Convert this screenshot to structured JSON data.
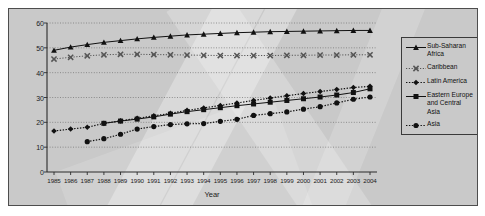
{
  "chart_data": {
    "type": "line",
    "title": "",
    "xlabel": "Year",
    "ylabel": "Percent female (%)",
    "xlim": [
      1985,
      2004
    ],
    "ylim": [
      0,
      60
    ],
    "ytick_step": 10,
    "yticks": [
      0,
      10,
      20,
      30,
      40,
      50,
      60
    ],
    "grid": true,
    "grid_style": "dotted-horizontal",
    "legend_position": "right-outside",
    "x": [
      1985,
      1986,
      1987,
      1988,
      1989,
      1990,
      1991,
      1992,
      1993,
      1994,
      1995,
      1996,
      1997,
      1998,
      1999,
      2000,
      2001,
      2002,
      2003,
      2004
    ],
    "categories": [
      "1985",
      "1986",
      "1987",
      "1988",
      "1989",
      "1990",
      "1991",
      "1992",
      "1993",
      "1994",
      "1995",
      "1996",
      "1997",
      "1998",
      "1999",
      "2000",
      "2001",
      "2002",
      "2003",
      "2004"
    ],
    "series": [
      {
        "name": "Sub-Saharan Africa",
        "marker": "triangle",
        "line": "solid",
        "color": "#111111",
        "x": [
          1985,
          1986,
          1987,
          1988,
          1989,
          1990,
          1991,
          1992,
          1993,
          1994,
          1995,
          1996,
          1997,
          1998,
          1999,
          2000,
          2001,
          2002,
          2003,
          2004
        ],
        "values": [
          49.0,
          50.3,
          51.3,
          52.2,
          52.9,
          53.6,
          54.2,
          54.7,
          55.2,
          55.5,
          55.8,
          56.1,
          56.3,
          56.5,
          56.6,
          56.7,
          56.8,
          56.9,
          57.0,
          57.0
        ]
      },
      {
        "name": "Caribbean",
        "marker": "x",
        "line": "dotted-light",
        "color": "#555555",
        "x": [
          1985,
          1986,
          1987,
          1988,
          1989,
          1990,
          1991,
          1992,
          1993,
          1994,
          1995,
          1996,
          1997,
          1998,
          1999,
          2000,
          2001,
          2002,
          2003,
          2004
        ],
        "values": [
          45.5,
          46.2,
          46.8,
          47.2,
          47.4,
          47.4,
          47.3,
          47.2,
          47.1,
          47.0,
          46.9,
          46.9,
          46.9,
          46.9,
          47.0,
          47.0,
          47.1,
          47.1,
          47.2,
          47.2
        ]
      },
      {
        "name": "Latin America",
        "marker": "diamond",
        "line": "dotted",
        "color": "#111111",
        "x": [
          1985,
          1986,
          1987,
          1988,
          1989,
          1990,
          1991,
          1992,
          1993,
          1994,
          1995,
          1996,
          1997,
          1998,
          1999,
          2000,
          2001,
          2002,
          2003,
          2004
        ],
        "values": [
          16.5,
          17.3,
          18.0,
          19.6,
          20.6,
          21.6,
          22.6,
          23.6,
          24.8,
          25.8,
          26.8,
          27.8,
          28.8,
          29.8,
          30.7,
          31.6,
          32.4,
          33.2,
          34.0,
          34.5
        ]
      },
      {
        "name": "Eastern Europe and Central Asia",
        "marker": "square",
        "line": "solid",
        "color": "#111111",
        "x": [
          1988,
          1989,
          1990,
          1991,
          1992,
          1993,
          1994,
          1995,
          1996,
          1997,
          1998,
          1999,
          2000,
          2001,
          2002,
          2003,
          2004
        ],
        "values": [
          19.6,
          20.5,
          21.3,
          22.2,
          23.3,
          24.3,
          25.1,
          25.9,
          26.7,
          27.4,
          28.1,
          28.8,
          29.5,
          30.2,
          31.0,
          32.0,
          33.5
        ]
      },
      {
        "name": "Asia",
        "marker": "circle",
        "line": "dotted",
        "color": "#111111",
        "x": [
          1987,
          1988,
          1989,
          1990,
          1991,
          1992,
          1993,
          1994,
          1995,
          1996,
          1997,
          1998,
          1999,
          2000,
          2001,
          2002,
          2003,
          2004
        ],
        "values": [
          12.2,
          13.4,
          15.2,
          17.3,
          18.3,
          19.1,
          19.4,
          19.5,
          20.4,
          21.2,
          22.8,
          23.5,
          24.2,
          25.3,
          26.3,
          27.8,
          29.3,
          30.2
        ]
      }
    ]
  },
  "axes": {
    "ylabel": "Percent female (%)",
    "xlabel": "Year"
  },
  "legend": {
    "items": [
      {
        "label": "Sub-Saharan Africa",
        "marker": "triangle",
        "line": "solid"
      },
      {
        "label": "Caribbean",
        "marker": "x",
        "line": "dotted-light"
      },
      {
        "label": "Latin America",
        "marker": "diamond",
        "line": "dotted"
      },
      {
        "label": "Eastern Europe and Central Asia",
        "marker": "square",
        "line": "solid"
      },
      {
        "label": "Asia",
        "marker": "circle",
        "line": "dotted"
      }
    ]
  },
  "colors": {
    "figure_background": "#c9c9c9",
    "page_background": "#ffffff",
    "frame_border": "#4d4d4d",
    "ink": "#111111",
    "grid": "#6f6f6f",
    "caribbean_gray": "#555555"
  }
}
